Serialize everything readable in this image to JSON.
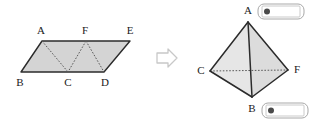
{
  "figure": {
    "transform_arrow": {
      "icon": "right-arrow-icon",
      "label": "⇒"
    },
    "colors": {
      "fill": "#d4d4d4",
      "fill_light": "#e6e6e6",
      "fill_mid": "#dcdcdc",
      "stroke": "#2b2b2b",
      "dotted": "#5a5a5a",
      "arrow_stroke": "#c8c8c8",
      "badge_stroke": "#a8a8a8",
      "badge_dot": "#4a4a4a",
      "label_text": "#1a1a1a"
    },
    "left": {
      "name": "parallelogram-figure",
      "shape": "parallelogram",
      "outline_points": "42,41 130,41 104,72 21,72",
      "fold_lines": [
        {
          "name": "fold-line-a-c",
          "points": "42,41 68,72"
        },
        {
          "name": "fold-line-f-c",
          "points": "86,41 68,72"
        },
        {
          "name": "fold-line-f-d",
          "points": "86,41 104,72"
        }
      ],
      "vertices": [
        {
          "id": "A",
          "label": "A",
          "x": 42,
          "y": 41,
          "lx": 41,
          "ly": 31
        },
        {
          "id": "F",
          "label": "F",
          "x": 86,
          "y": 41,
          "lx": 85,
          "ly": 31
        },
        {
          "id": "E",
          "label": "E",
          "x": 130,
          "y": 41,
          "lx": 130,
          "ly": 31
        },
        {
          "id": "B",
          "label": "B",
          "x": 21,
          "y": 72,
          "lx": 20,
          "ly": 83
        },
        {
          "id": "C",
          "label": "C",
          "x": 68,
          "y": 72,
          "lx": 68,
          "ly": 83
        },
        {
          "id": "D",
          "label": "D",
          "x": 104,
          "y": 72,
          "lx": 105,
          "ly": 83
        }
      ]
    },
    "right": {
      "name": "tetrahedron-figure",
      "shape": "tetrahedron",
      "faces": [
        {
          "name": "face-a-c-b",
          "points": "248,22 210,71 252,97",
          "tone": "fill_light"
        },
        {
          "name": "face-a-b-f",
          "points": "248,22 252,97 288,70",
          "tone": "fill_mid"
        }
      ],
      "edges": [
        {
          "name": "edge-a-c",
          "points": "248,22 210,71",
          "style": "solid"
        },
        {
          "name": "edge-a-f",
          "points": "248,22 288,70",
          "style": "solid"
        },
        {
          "name": "edge-a-b",
          "points": "248,22 252,97",
          "style": "solid"
        },
        {
          "name": "edge-c-b",
          "points": "210,71 252,97",
          "style": "solid"
        },
        {
          "name": "edge-b-f",
          "points": "252,97 288,70",
          "style": "solid"
        },
        {
          "name": "edge-c-f",
          "points": "210,71 288,70",
          "style": "dotted"
        }
      ],
      "vertices": [
        {
          "id": "A",
          "label": "A",
          "x": 248,
          "y": 22,
          "lx": 248,
          "ly": 11
        },
        {
          "id": "C",
          "label": "C",
          "x": 210,
          "y": 71,
          "lx": 201,
          "ly": 71
        },
        {
          "id": "F",
          "label": "F",
          "x": 288,
          "y": 70,
          "lx": 297,
          "ly": 70
        },
        {
          "id": "B",
          "label": "B",
          "x": 252,
          "y": 97,
          "lx": 252,
          "ly": 109
        }
      ],
      "badges": [
        {
          "name": "badge-near-a",
          "anchor_vertex": "A",
          "x": 258,
          "y": 4,
          "w": 46,
          "h": 15,
          "marker": "❶",
          "dot": "filled-circle-icon"
        },
        {
          "name": "badge-near-b",
          "anchor_vertex": "B",
          "x": 262,
          "y": 103,
          "w": 46,
          "h": 15,
          "marker": "❷",
          "dot": "filled-circle-icon"
        }
      ]
    }
  }
}
